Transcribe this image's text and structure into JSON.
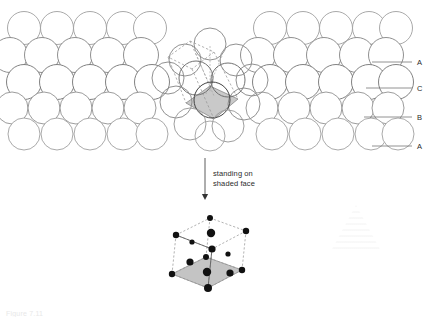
{
  "figure": {
    "kind": "crystal-structure-diagram",
    "title_caption": "Figure 7.11",
    "annotation": {
      "line1": "standing on",
      "line2": "shaded face"
    },
    "stacking_labels": [
      {
        "id": "label-a-top",
        "text": "A",
        "y": 62,
        "leader_x1": 372,
        "leader_x2": 412
      },
      {
        "id": "label-c",
        "text": "C",
        "y": 88,
        "leader_x1": 366,
        "leader_x2": 412
      },
      {
        "id": "label-b",
        "text": "B",
        "y": 117,
        "leader_x1": 364,
        "leader_x2": 412
      },
      {
        "id": "label-a-bottom",
        "text": "A",
        "y": 146,
        "leader_x1": 372,
        "leader_x2": 412
      }
    ],
    "colors": {
      "sphere_outline": "#8a8a8a",
      "sphere_outline_dark": "#4a4a4a",
      "sphere_fill": "#ffffff",
      "shaded_face": "#c9c9c9",
      "shaded_face_cube": "#c4c4c4",
      "cell_edge": "#909090",
      "lattice_point": "#111111",
      "leader_line": "#6f6f6f",
      "arrow": "#333333",
      "background": "#ffffff"
    },
    "panels": {
      "left": {
        "name": "close-packed-layers-left",
        "x": 6,
        "y": 8,
        "width": 150,
        "height": 145
      },
      "center": {
        "name": "unit-cell-face-cluster",
        "x": 160,
        "y": 12,
        "width": 100,
        "height": 140
      },
      "right": {
        "name": "close-packed-layers-right",
        "x": 258,
        "y": 8,
        "width": 150,
        "height": 145
      },
      "bottom": {
        "name": "fcc-unit-cell",
        "x": 160,
        "y": 210,
        "width": 120,
        "height": 95
      }
    },
    "arrow": {
      "x": 205,
      "y_start": 158,
      "y_end": 200
    }
  },
  "left_panel": {
    "name": "close-packed-sphere-rows-left",
    "radius": 16.5,
    "rows": [
      {
        "cy": 28,
        "r": 16.5,
        "stroke": "#9a9a9a",
        "cxs": [
          24,
          57,
          90,
          123,
          150
        ]
      },
      {
        "cy": 55,
        "r": 17.5,
        "stroke": "#7c7c7c",
        "cxs": [
          10,
          42,
          75,
          108,
          141
        ]
      },
      {
        "cy": 82,
        "r": 17.5,
        "stroke": "#6b6b6b",
        "cxs": [
          24,
          57,
          90,
          123,
          152
        ]
      },
      {
        "cy": 108,
        "r": 16.0,
        "stroke": "#8a8a8a",
        "cxs": [
          12,
          44,
          76,
          108,
          140
        ]
      },
      {
        "cy": 134,
        "r": 16.0,
        "stroke": "#9a9a9a",
        "cxs": [
          24,
          57,
          90,
          123,
          152
        ]
      }
    ]
  },
  "right_panel": {
    "name": "close-packed-sphere-rows-right",
    "radius": 16.5,
    "rows": [
      {
        "cy": 28,
        "r": 16.5,
        "stroke": "#9a9a9a",
        "cxs": [
          270,
          303,
          336,
          369,
          396
        ]
      },
      {
        "cy": 55,
        "r": 17.5,
        "stroke": "#7c7c7c",
        "cxs": [
          258,
          291,
          324,
          357,
          386
        ]
      },
      {
        "cy": 82,
        "r": 17.5,
        "stroke": "#6b6b6b",
        "cxs": [
          270,
          303,
          336,
          369,
          396
        ]
      },
      {
        "cy": 108,
        "r": 16.0,
        "stroke": "#8a8a8a",
        "cxs": [
          262,
          294,
          326,
          358,
          388
        ]
      },
      {
        "cy": 134,
        "r": 16.0,
        "stroke": "#9a9a9a",
        "cxs": [
          272,
          305,
          338,
          371,
          398
        ]
      }
    ]
  },
  "center_panel": {
    "name": "highlighted-face-cluster",
    "shaded_face": {
      "name": "shaded-rhombic-face",
      "points": "186,103 210,86 238,99 214,119"
    },
    "cell_outline": {
      "name": "dashed-unit-cell-outline",
      "segments": [
        "168,57 190,41",
        "190,41 214,52",
        "214,52 192,69",
        "192,69 168,57",
        "168,57 186,103",
        "190,41 210,86",
        "214,52 238,99",
        "192,69 214,119"
      ]
    },
    "axis_lines": [
      "210,46 210,92",
      "196,54 214,96",
      "222,56 206,94"
    ],
    "spheres": [
      {
        "cx": 210,
        "cy": 44,
        "r": 16,
        "stroke": "#8a8a8a"
      },
      {
        "cx": 185,
        "cy": 60,
        "r": 16,
        "stroke": "#8a8a8a"
      },
      {
        "cx": 236,
        "cy": 60,
        "r": 16,
        "stroke": "#8a8a8a"
      },
      {
        "cx": 168,
        "cy": 78,
        "r": 16,
        "stroke": "#8a8a8a"
      },
      {
        "cx": 252,
        "cy": 80,
        "r": 16,
        "stroke": "#8a8a8a"
      },
      {
        "cx": 196,
        "cy": 78,
        "r": 17,
        "stroke": "#6a6a6a"
      },
      {
        "cx": 228,
        "cy": 80,
        "r": 17,
        "stroke": "#6a6a6a"
      },
      {
        "cx": 176,
        "cy": 102,
        "r": 16,
        "stroke": "#8a8a8a"
      },
      {
        "cx": 244,
        "cy": 104,
        "r": 16,
        "stroke": "#8a8a8a"
      },
      {
        "cx": 212,
        "cy": 100,
        "r": 18,
        "stroke": "#3a3a3a"
      },
      {
        "cx": 190,
        "cy": 124,
        "r": 16,
        "stroke": "#9a9a9a"
      },
      {
        "cx": 228,
        "cy": 126,
        "r": 16,
        "stroke": "#9a9a9a"
      },
      {
        "cx": 210,
        "cy": 136,
        "r": 15,
        "stroke": "#a5a5a5"
      }
    ]
  },
  "cube_panel": {
    "name": "fcc-unit-cell-isometric",
    "geometry": {
      "top_face": "176,235 210,218 246,231 212,249",
      "bottom_face": "172,274 206,257 242,270 208,288",
      "shaded_bottom_face": "172,274 206,257 242,270 208,288",
      "verticals": [
        "176,235 172,274",
        "210,218 206,257",
        "246,231 242,270",
        "212,249 208,288"
      ],
      "solid_edges": [
        "176,235 212,249",
        "212,249 208,288"
      ]
    },
    "lattice_points": [
      {
        "cx": 176,
        "cy": 235,
        "r": 3.2,
        "kind": "corner"
      },
      {
        "cx": 210,
        "cy": 218,
        "r": 3.0,
        "kind": "corner"
      },
      {
        "cx": 246,
        "cy": 231,
        "r": 3.2,
        "kind": "corner"
      },
      {
        "cx": 212,
        "cy": 249,
        "r": 3.6,
        "kind": "corner"
      },
      {
        "cx": 172,
        "cy": 274,
        "r": 3.2,
        "kind": "corner"
      },
      {
        "cx": 206,
        "cy": 257,
        "r": 3.0,
        "kind": "corner"
      },
      {
        "cx": 242,
        "cy": 270,
        "r": 3.2,
        "kind": "corner"
      },
      {
        "cx": 208,
        "cy": 288,
        "r": 4.0,
        "kind": "corner"
      },
      {
        "cx": 211,
        "cy": 233,
        "r": 4.2,
        "kind": "face-center-top"
      },
      {
        "cx": 207,
        "cy": 272,
        "r": 4.2,
        "kind": "face-center-bottom"
      },
      {
        "cx": 192,
        "cy": 242,
        "r": 2.6,
        "kind": "face-center-back-left"
      },
      {
        "cx": 228,
        "cy": 254,
        "r": 2.6,
        "kind": "face-center-back-right"
      },
      {
        "cx": 190,
        "cy": 262,
        "r": 3.6,
        "kind": "face-center-left"
      },
      {
        "cx": 230,
        "cy": 273,
        "r": 3.6,
        "kind": "face-center-right"
      }
    ]
  }
}
